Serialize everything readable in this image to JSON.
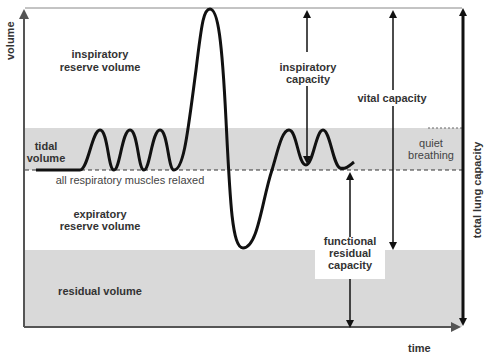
{
  "diagram": {
    "axes": {
      "y_label": "volume",
      "x_label": "time"
    },
    "regions": {
      "inspiratory_reserve_volume": [
        "inspiratory",
        "reserve volume"
      ],
      "tidal_volume": [
        "tidal",
        "volume"
      ],
      "baseline_label": "all respiratory muscles relaxed",
      "expiratory_reserve_volume": [
        "expiratory",
        "reserve volume"
      ],
      "residual_volume": "residual volume"
    },
    "capacities": {
      "inspiratory_capacity": [
        "inspiratory",
        "capacity"
      ],
      "vital_capacity": "vital capacity",
      "functional_residual_capacity": [
        "functional",
        "residual",
        "capacity"
      ],
      "total_lung_capacity": "total lung capacity",
      "quiet_breathing": [
        "quiet",
        "breathing"
      ]
    },
    "colors": {
      "band": "#d9d9d9",
      "line": "#111111",
      "axis": "#555555",
      "text": "#333333"
    }
  }
}
